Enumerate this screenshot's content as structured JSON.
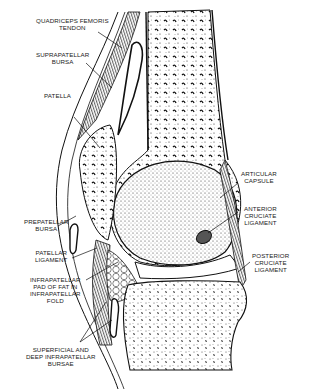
{
  "diagram": {
    "labels": [
      {
        "id": "quadriceps",
        "lines": [
          "QUADRICEPS FEMORIS",
          "TENDON"
        ]
      },
      {
        "id": "suprapatellar",
        "lines": [
          "SUPRAPATELLAR",
          "BURSA"
        ]
      },
      {
        "id": "patella",
        "lines": [
          "PATELLA"
        ]
      },
      {
        "id": "prepatellar",
        "lines": [
          "PREPATELLAR",
          "BURSA"
        ]
      },
      {
        "id": "patellar-ligament",
        "lines": [
          "PATELLAR",
          "LIGAMENT"
        ]
      },
      {
        "id": "infrapatellar-fat",
        "lines": [
          "INFRAPATELLAR",
          "PAD OF FAT IN",
          "INFRAPATELLAR",
          "FOLD"
        ]
      },
      {
        "id": "infrapatellar-bursae",
        "lines": [
          "SUPERFICIAL AND",
          "DEEP INFRAPATELLAR",
          "BURSAE"
        ]
      },
      {
        "id": "articular-capsule",
        "lines": [
          "ARTICULAR",
          "CAPSULE"
        ]
      },
      {
        "id": "anterior-cruciate",
        "lines": [
          "ANTERIOR",
          "CRUCIATE",
          "LIGAMENT"
        ]
      },
      {
        "id": "posterior-cruciate",
        "lines": [
          "POSTERIOR",
          "CRUCIATE",
          "LIGAMENT"
        ]
      }
    ]
  }
}
